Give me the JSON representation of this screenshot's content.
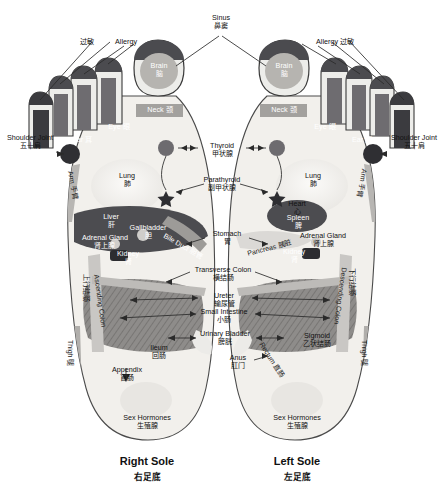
{
  "figure": {
    "title_right": "Right Sole",
    "title_right_cn": "右足底",
    "title_left": "Left Sole",
    "title_left_cn": "左足底"
  },
  "colors": {
    "skin": "#f2f0ec",
    "skin_edge": "#d8d4cd",
    "dark_zone": "#3a3a3c",
    "mid_gray": "#6e6e72",
    "light_gray": "#b9b7b4",
    "pale": "#e4e2de",
    "outline": "#2a2a2a",
    "text": "#111111",
    "text_light": "#ffffff"
  },
  "top_labels": [
    {
      "id": "allergy-left-cn",
      "en": "",
      "cn": "过敏"
    },
    {
      "id": "allergy-left",
      "en": "Allergy",
      "cn": ""
    },
    {
      "id": "sinus",
      "en": "Sinus",
      "cn": "鼻窦"
    },
    {
      "id": "allergy-right",
      "en": "Allergy 过敏",
      "cn": ""
    }
  ],
  "right_sole": {
    "name": "Right Sole",
    "zones": [
      {
        "id": "brain",
        "en": "Brain",
        "cn": "脑"
      },
      {
        "id": "neck",
        "en": "Neck 颈",
        "cn": ""
      },
      {
        "id": "eye",
        "en": "Eye 眼",
        "cn": ""
      },
      {
        "id": "ear",
        "en": "Ear 耳",
        "cn": ""
      },
      {
        "id": "shoulder-joint",
        "en": "Shoulder Joint",
        "cn": "五十肩"
      },
      {
        "id": "lung",
        "en": "Lung",
        "cn": "肺"
      },
      {
        "id": "liver",
        "en": "Liver",
        "cn": "肝"
      },
      {
        "id": "gallbladder",
        "en": "Gallbladder",
        "cn": "胆"
      },
      {
        "id": "bile-duct",
        "en": "Bile Duct 胆管",
        "cn": ""
      },
      {
        "id": "adrenal-gland",
        "en": "Adrenal Gland",
        "cn": "肾上腺"
      },
      {
        "id": "kidney",
        "en": "Kidney",
        "cn": "肾"
      },
      {
        "id": "appendix",
        "en": "Appendix",
        "cn": "盲肠"
      },
      {
        "id": "ileum",
        "en": "Ileum",
        "cn": "回肠"
      },
      {
        "id": "sex-hormones",
        "en": "Sex Hormones",
        "cn": "生殖腺"
      },
      {
        "id": "arm",
        "en": "Arm 手臂",
        "cn": ""
      },
      {
        "id": "ascending-colon",
        "en": "Ascending Colon",
        "cn": "上行结肠"
      },
      {
        "id": "thigh",
        "en": "Thigh 腿",
        "cn": ""
      }
    ]
  },
  "left_sole": {
    "name": "Left Sole",
    "zones": [
      {
        "id": "brain",
        "en": "Brain",
        "cn": "脑"
      },
      {
        "id": "neck",
        "en": "Neck 颈",
        "cn": ""
      },
      {
        "id": "eye",
        "en": "Eye 眼",
        "cn": ""
      },
      {
        "id": "ear",
        "en": "Ear 耳",
        "cn": ""
      },
      {
        "id": "shoulder-joint",
        "en": "Shoulder Joint",
        "cn": "五十肩"
      },
      {
        "id": "lung",
        "en": "Lung",
        "cn": "肺"
      },
      {
        "id": "heart",
        "en": "Heart",
        "cn": "心"
      },
      {
        "id": "spleen",
        "en": "Spleen",
        "cn": "脾"
      },
      {
        "id": "pancreas",
        "en": "Pancreas 胰脏",
        "cn": ""
      },
      {
        "id": "adrenal-gland",
        "en": "Adrenal Gland",
        "cn": "肾上腺"
      },
      {
        "id": "kidney",
        "en": "Kidney",
        "cn": "肾"
      },
      {
        "id": "sigmoid",
        "en": "Sigmoid",
        "cn": "乙状结肠"
      },
      {
        "id": "rectum",
        "en": "Rectum 直肠",
        "cn": ""
      },
      {
        "id": "sex-hormones",
        "en": "Sex Hormones",
        "cn": "生殖腺"
      },
      {
        "id": "arm",
        "en": "Arm 手臂",
        "cn": ""
      },
      {
        "id": "descending-colon",
        "en": "Descending Colon",
        "cn": "下行结肠"
      },
      {
        "id": "thigh",
        "en": "Thigh 腿",
        "cn": ""
      }
    ]
  },
  "center_labels": [
    {
      "id": "thyroid",
      "en": "Thyroid",
      "cn": "甲状腺"
    },
    {
      "id": "parathyroid",
      "en": "Parathyroid",
      "cn": "副甲状腺"
    },
    {
      "id": "stomach",
      "en": "Stomach",
      "cn": "胃"
    },
    {
      "id": "transverse-colon",
      "en": "Transverse Colon",
      "cn": "横结肠"
    },
    {
      "id": "ureter",
      "en": "Ureter",
      "cn": "输尿管"
    },
    {
      "id": "small-intestine",
      "en": "Small Intestine",
      "cn": "小肠"
    },
    {
      "id": "urinary-bladder",
      "en": "Urinary Bladder",
      "cn": "膀胱"
    },
    {
      "id": "anus",
      "en": "Anus",
      "cn": "肛门"
    }
  ]
}
